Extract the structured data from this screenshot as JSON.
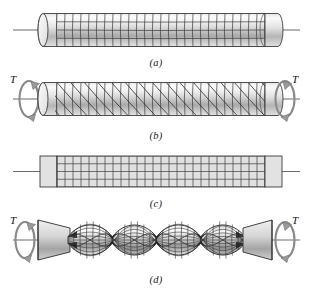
{
  "figure": {
    "background_color": "#ffffff",
    "line_color": "#2b2b2b",
    "fill_light": "#f2f2f2",
    "fill_mid": "#c9c9c9",
    "fill_dark": "#8e8e8e",
    "grid_color": "#3a3a3a"
  },
  "panels": [
    {
      "id": "a",
      "caption": "(a)",
      "description": "Undeformed circular shaft with rectangular surface grid",
      "shape": "cylinder",
      "grid": {
        "type": "rectangular",
        "columns": 26,
        "rows": 4
      },
      "has_torque": false,
      "shaded": true
    },
    {
      "id": "b",
      "caption": "(b)",
      "description": "Shaft twisted by torque T showing helical (sheared) grid lines",
      "shape": "cylinder",
      "grid": {
        "type": "helical",
        "columns": 26,
        "rows": 4,
        "shear": true
      },
      "has_torque": true,
      "shaded": true
    },
    {
      "id": "c",
      "caption": "(c)",
      "description": "Flat unrolled surface with undeformed rectangular grid",
      "shape": "flat-rectangle",
      "grid": {
        "type": "rectangular",
        "columns": 26,
        "rows": 4
      },
      "has_torque": false,
      "shaded": false
    },
    {
      "id": "d",
      "caption": "(d)",
      "description": "Severely twisted shaft under torque T, necking at pinch points",
      "shape": "twisted-rope",
      "grid": {
        "type": "helical",
        "columns": 26,
        "rows": 4,
        "shear": true
      },
      "has_torque": true,
      "shaded": true,
      "pinch_points": 3
    }
  ],
  "torque_labels": {
    "panel_b_left": "T",
    "panel_b_right": "T",
    "panel_d_left": "T",
    "panel_d_right": "T"
  },
  "icons": {
    "torque_arrow": "circular-arrow-icon",
    "axis": "axis-line-icon"
  }
}
